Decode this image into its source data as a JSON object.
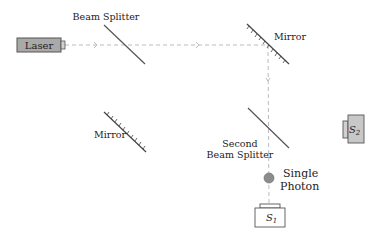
{
  "diagram": {
    "type": "Mach-Zehnder interferometer",
    "components": {
      "laser": {
        "label": "Laser",
        "fill": "#a9a9a9"
      },
      "beam_splitter": {
        "label": "Beam Splitter"
      },
      "mirror_top": {
        "label": "Mirror"
      },
      "mirror_bottom": {
        "label": "Mirror"
      },
      "second_beam_splitter": {
        "label_line1": "Second",
        "label_line2": "Beam Splitter"
      },
      "photon": {
        "label_line1": "Single",
        "label_line2": "Photon",
        "fill": "#8c8c8c"
      },
      "detector_s1": {
        "label": "S",
        "subscript": "1",
        "fill": "#ffffff"
      },
      "detector_s2": {
        "label": "S",
        "subscript": "2",
        "fill": "#c8c8c8"
      }
    },
    "colors": {
      "beam": "#bbbbbb",
      "line": "#555555",
      "text": "#222222"
    }
  }
}
